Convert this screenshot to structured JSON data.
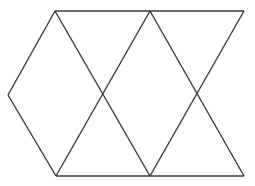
{
  "figure": {
    "background_color": "#ffffff",
    "stroke_color": "#3a3a3a",
    "stroke_width": 1.4,
    "canvas": {
      "width": 255,
      "height": 186
    },
    "vertices": {
      "top_left": {
        "name": "top-left-vertex",
        "x": 55,
        "y": 11
      },
      "top_mid": {
        "name": "top-middle-vertex",
        "x": 150,
        "y": 11
      },
      "top_right": {
        "name": "top-right-vertex",
        "x": 244,
        "y": 11
      },
      "left_apex": {
        "name": "left-apex-vertex",
        "x": 8,
        "y": 95
      },
      "bottom_left": {
        "name": "bottom-left-vertex",
        "x": 56,
        "y": 176
      },
      "bottom_mid": {
        "name": "bottom-middle-vertex",
        "x": 150,
        "y": 176
      },
      "bottom_right": {
        "name": "bottom-right-vertex",
        "x": 244,
        "y": 176
      },
      "cross_left": {
        "name": "left-crossing-point",
        "x": 102,
        "y": 95
      },
      "cross_right": {
        "name": "right-crossing-point",
        "x": 196,
        "y": 95
      }
    },
    "segments": [
      {
        "id": "top-edge",
        "label": "Top horizontal edge",
        "points": "55,11 244,11"
      },
      {
        "id": "bottom-edge",
        "label": "Bottom horizontal edge",
        "points": "56,176 244,176"
      },
      {
        "id": "left-upper-diagonal",
        "label": "Upper-left diagonal",
        "points": "55,11 8,95"
      },
      {
        "id": "left-lower-diagonal",
        "label": "Lower-left diagonal",
        "points": "8,95 56,176"
      },
      {
        "id": "diagonal-a",
        "label": "Diagonal from top-left to bottom-middle",
        "points": "55,11 150,176"
      },
      {
        "id": "diagonal-b",
        "label": "Diagonal from top-middle to bottom-left",
        "points": "150,11 56,176"
      },
      {
        "id": "diagonal-c",
        "label": "Diagonal from top-middle to bottom-right",
        "points": "150,11 244,176"
      },
      {
        "id": "diagonal-d",
        "label": "Diagonal from top-right to bottom-middle",
        "points": "244,11 150,176"
      }
    ]
  }
}
